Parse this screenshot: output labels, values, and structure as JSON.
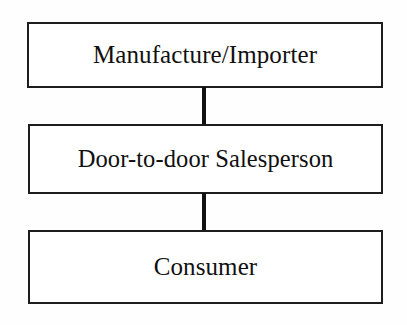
{
  "diagram": {
    "type": "flow-chart",
    "orientation": "vertical",
    "background_color": "#ffffff",
    "line_color": "#111111",
    "text_color": "#101010",
    "nodes": [
      {
        "id": "manufacturer",
        "label": "Manufacture/Importer"
      },
      {
        "id": "salesperson",
        "label": "Door-to-door Salesperson"
      },
      {
        "id": "consumer",
        "label": "Consumer"
      }
    ],
    "connectors": [
      {
        "id": "manufacturer-salesperson",
        "from": "manufacturer",
        "to": "salesperson"
      },
      {
        "id": "salesperson-consumer",
        "from": "salesperson",
        "to": "consumer"
      }
    ]
  }
}
